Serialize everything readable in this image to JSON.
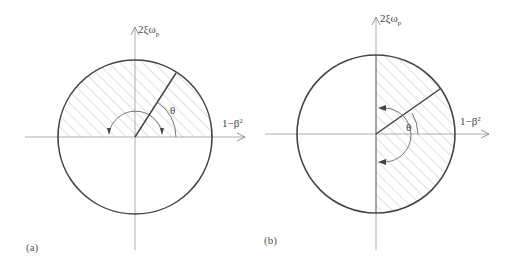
{
  "figure": {
    "panels": [
      {
        "id": "a",
        "label": "(a)",
        "y_axis_label": "2ξω",
        "y_axis_subscript": "p",
        "x_axis_label": "1−β",
        "x_axis_superscript": "2",
        "angle_label": "θ",
        "shaded_region": "upper half-disk (above horizontal axis)",
        "radial_line_angle_deg": 58
      },
      {
        "id": "b",
        "label": "(b)",
        "y_axis_label": "2ξω",
        "y_axis_subscript": "p",
        "x_axis_label": "1−β",
        "x_axis_superscript": "2",
        "angle_label": "θ",
        "shaded_region": "right half-disk (right of vertical axis)",
        "radial_line_angle_deg": 30
      }
    ],
    "colors": {
      "circle": "#444444",
      "axis": "#999999",
      "hatch": "#bbbbbb",
      "text": "#444444"
    }
  }
}
